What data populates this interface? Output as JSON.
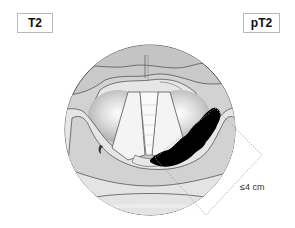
{
  "labels": {
    "left": "T2",
    "right": "pT2"
  },
  "measurement": {
    "text": "≤4 cm"
  },
  "colors": {
    "outer_ring": "#c9c9c9",
    "mid_band": "#dcdcdc",
    "light_band": "#ececec",
    "folds": "#bdbdbd",
    "cords": "#f4f4f4",
    "tumor": "#000000",
    "outline": "#555555",
    "dotted_box": "#9a9a9a"
  }
}
